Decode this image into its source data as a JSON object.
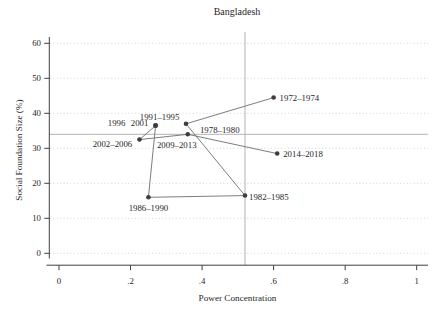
{
  "title": "Bangladesh",
  "colors": {
    "background": "#ffffff",
    "axis": "#3f3f3f",
    "text": "#1f1f1f",
    "grid": "#d0d0d0",
    "refline": "#b3b3b3",
    "connector": "#6e6e6e",
    "marker": "#3d3d3d"
  },
  "chart_data": {
    "type": "scatter",
    "connected": true,
    "title": "Bangladesh",
    "xlabel": "Power Concentration",
    "ylabel": "Social Foundation Size (%)",
    "xlim": [
      0,
      1
    ],
    "ylim": [
      0,
      60
    ],
    "xticks": [
      0,
      0.2,
      0.4,
      0.6,
      0.8,
      1
    ],
    "xtick_labels": [
      "0",
      ".2",
      ".4",
      ".6",
      ".8",
      "1"
    ],
    "yticks": [
      0,
      10,
      20,
      30,
      40,
      50,
      60
    ],
    "ytick_labels": [
      "0",
      "10",
      "20",
      "30",
      "40",
      "50",
      "60"
    ],
    "grid": "horizontal-dotted",
    "legend": "none",
    "ref_line_x": 0.52,
    "ref_line_y": 34,
    "points": [
      {
        "label": "1972–1974",
        "x": 0.6,
        "y": 44.5,
        "anchor": "start",
        "ldx": 6,
        "ldy": 3.5
      },
      {
        "label": "1978–1980",
        "x": 0.355,
        "y": 37,
        "anchor": "start",
        "ldx": 14,
        "ldy": 9
      },
      {
        "label": "1982–1985",
        "x": 0.52,
        "y": 16.5,
        "anchor": "start",
        "ldx": 4,
        "ldy": 4
      },
      {
        "label": "1986–1990",
        "x": 0.25,
        "y": 16,
        "anchor": "middle",
        "ldx": 0,
        "ldy": 14
      },
      {
        "label": "1991–1995",
        "x": 0.27,
        "y": 36.5,
        "anchor": "middle",
        "ldx": 4,
        "ldy": -6
      },
      {
        "label": "1996",
        "x": 0.27,
        "y": 36.5,
        "anchor": "middle",
        "ldx": -39,
        "ldy": 0.5
      },
      {
        "label": "2001",
        "x": 0.27,
        "y": 36.5,
        "anchor": "middle",
        "ldx": -16,
        "ldy": 0.5
      },
      {
        "label": "2002–2006",
        "x": 0.225,
        "y": 32.5,
        "anchor": "middle",
        "ldx": -27,
        "ldy": 7.5
      },
      {
        "label": "2009–2013",
        "x": 0.36,
        "y": 34,
        "anchor": "middle",
        "ldx": -11,
        "ldy": 14
      },
      {
        "label": "2014–2018",
        "x": 0.61,
        "y": 28.5,
        "anchor": "start",
        "ldx": 6,
        "ldy": 3.5
      }
    ]
  }
}
